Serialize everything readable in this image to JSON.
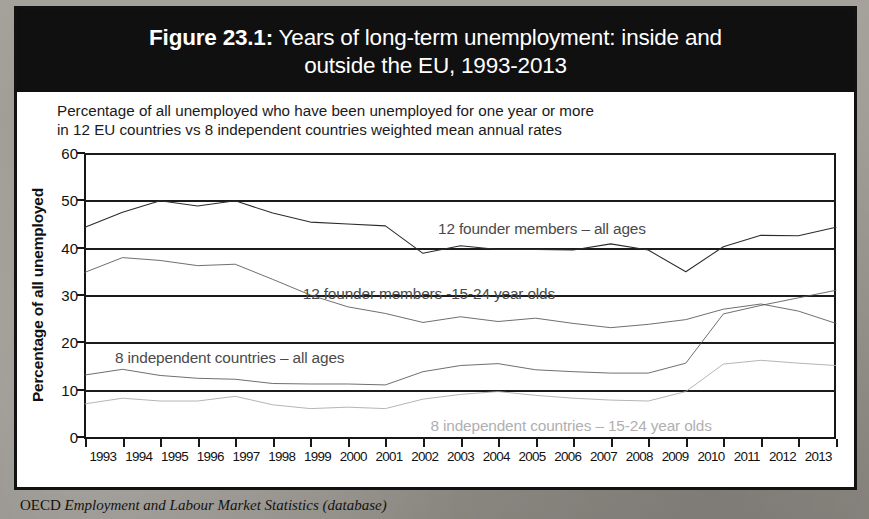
{
  "figure": {
    "title_label": "Figure 23.1:",
    "title_rest": " Years of long-term unemployment: inside and",
    "title_line2": "outside the EU, 1993-2013",
    "subtitle_line1": "Percentage of all unemployed who have been unemployed for one year or more",
    "subtitle_line2": "in 12 EU countries vs 8 independent countries weighted mean annual rates",
    "source_lead": "OECD",
    "source_rest": " Employment and Labour Market Statistics (database)"
  },
  "colors": {
    "title_band": "#101010",
    "page_background": "#9d9a93",
    "figure_background": "#ffffff",
    "series_dark": "#2b2b2b",
    "series_mid": "#555555",
    "series_grey": "#777777",
    "series_light": "#a8a8a8",
    "grid": "#1b1b1b"
  },
  "chart_data": {
    "type": "line",
    "title": "Years of long-term unemployment: inside and outside the EU, 1993-2013",
    "subtitle": "Percentage of all unemployed who have been unemployed for one year or more in 12 EU countries vs 8 independent countries weighted mean annual rates",
    "xlabel": "",
    "ylabel": "Percentage of all unemployed",
    "ylim": [
      0,
      60
    ],
    "yticks": [
      0,
      10,
      20,
      30,
      40,
      50,
      60
    ],
    "grid": true,
    "legend_position": "inline-annotations",
    "categories": [
      "1993",
      "1994",
      "1995",
      "1996",
      "1997",
      "1998",
      "1999",
      "2000",
      "2001",
      "2002",
      "2003",
      "2004",
      "2005",
      "2006",
      "2007",
      "2008",
      "2009",
      "2010",
      "2011",
      "2012",
      "2013"
    ],
    "series": [
      {
        "name": "12 founder members – all ages",
        "color": "#2b2b2b",
        "label_x_pct": 47.0,
        "label_y_value": 45.8,
        "values": [
          44.3,
          47.5,
          49.9,
          48.8,
          49.9,
          47.3,
          45.4,
          45.0,
          44.6,
          38.8,
          40.4,
          39.6,
          39.6,
          39.5,
          40.8,
          39.5,
          34.9,
          40.2,
          42.6,
          42.5,
          44.3
        ]
      },
      {
        "name": "12 founder members -15-24 year olds",
        "color": "#555555",
        "label_x_pct": 29.0,
        "label_y_value": 32.2,
        "values": [
          34.8,
          37.9,
          37.3,
          36.2,
          36.5,
          33.3,
          30.0,
          27.5,
          26.1,
          24.2,
          25.4,
          24.4,
          25.1,
          24.0,
          23.1,
          23.8,
          24.8,
          27.0,
          28.1,
          26.6,
          24.0
        ]
      },
      {
        "name": "8 independent countries – all ages",
        "color": "#555555",
        "label_x_pct": 4.0,
        "label_y_value": 18.5,
        "values": [
          13.1,
          14.3,
          13.0,
          12.4,
          12.2,
          11.3,
          11.2,
          11.2,
          11.0,
          13.8,
          15.1,
          15.5,
          14.2,
          13.8,
          13.5,
          13.5,
          15.6,
          26.0,
          27.8,
          29.4,
          31.0
        ]
      },
      {
        "name": "8 independent countries – 15-24 year olds",
        "color": "#a8a8a8",
        "label_x_pct": 46.0,
        "label_y_value": 4.2,
        "values": [
          7.0,
          8.2,
          7.6,
          7.6,
          8.6,
          6.8,
          6.0,
          6.3,
          6.0,
          8.0,
          9.0,
          9.6,
          8.8,
          8.2,
          7.8,
          7.6,
          9.6,
          15.4,
          16.2,
          15.6,
          15.1
        ]
      }
    ]
  }
}
